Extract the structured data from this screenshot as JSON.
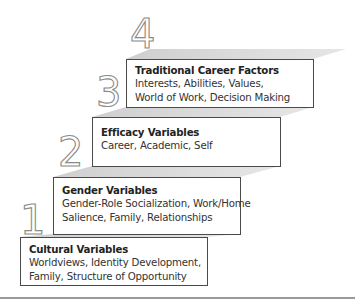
{
  "diagram": {
    "type": "staircase",
    "colors": {
      "box_border": "#4a4a4a",
      "shadow": "#d4d4d4",
      "numeral_stroke": "#8a8a8a",
      "rule": "#9a9a9a"
    },
    "steps": [
      {
        "number": "1",
        "title": "Cultural Variables",
        "lines": [
          "Worldviews, Identity Development,",
          "Family, Structure of Opportunity"
        ]
      },
      {
        "number": "2",
        "title": "Gender Variables",
        "lines": [
          "Gender-Role Socialization, Work/Home",
          "Salience, Family, Relationships"
        ]
      },
      {
        "number": "3",
        "title": "Efficacy Variables",
        "lines": [
          "Career, Academic, Self"
        ]
      },
      {
        "number": "4",
        "title": "Traditional Career Factors",
        "lines": [
          "Interests, Abilities, Values,",
          "World of Work, Decision Making"
        ]
      }
    ]
  }
}
